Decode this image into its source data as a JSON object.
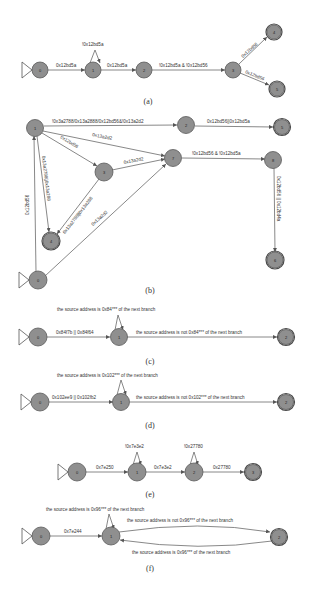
{
  "figures": [
    {
      "caption": "(a)",
      "nodes": [
        "0",
        "1",
        "2",
        "3",
        "4",
        "5"
      ],
      "start": "0",
      "accepting": [
        "4",
        "5"
      ],
      "edges": [
        {
          "from": "0",
          "to": "1",
          "label": "0x12bd5a"
        },
        {
          "from": "1",
          "to": "1",
          "label": "!0x12bd5a"
        },
        {
          "from": "1",
          "to": "2",
          "label": "0x12bd5a"
        },
        {
          "from": "2",
          "to": "3",
          "label": "!0x12bd5a & !0x12bd56"
        },
        {
          "from": "3",
          "to": "4",
          "label": "0x12bd56"
        },
        {
          "from": "3",
          "to": "5",
          "label": "0x12bd56"
        }
      ]
    },
    {
      "caption": "(b)",
      "nodes": [
        "0",
        "1",
        "2",
        "3",
        "4",
        "5",
        "6",
        "7",
        "8"
      ],
      "start": "0",
      "accepting": [
        "4",
        "5",
        "6"
      ],
      "edges": [
        {
          "from": "1",
          "to": "2",
          "label": "!0x3a2788/0x13a2888/0x12bd56&!0x13a2d2"
        },
        {
          "from": "2",
          "to": "5",
          "label": "0x12bd56||0x12bd5a"
        },
        {
          "from": "1",
          "to": "7",
          "label": "0x13a2d2"
        },
        {
          "from": "1",
          "to": "3",
          "label": "0x12bd56"
        },
        {
          "from": "3",
          "to": "7",
          "label": "0x13a2d2"
        },
        {
          "from": "1",
          "to": "4",
          "label": "0x13a2788||0x13a288"
        },
        {
          "from": "3",
          "to": "4",
          "label": "0x13a2788||0x13a288"
        },
        {
          "from": "0",
          "to": "1",
          "label": "0x12bd56"
        },
        {
          "from": "0",
          "to": "7",
          "label": "0x13a2d2"
        },
        {
          "from": "7",
          "to": "8",
          "label": "!0x12bd56 & !0x12bd5a"
        },
        {
          "from": "8",
          "to": "6",
          "label": "0x12bd56 || 0x12bd4a"
        }
      ]
    },
    {
      "caption": "(c)",
      "nodes": [
        "0",
        "1",
        "2"
      ],
      "start": "0",
      "accepting": [
        "2"
      ],
      "edges": [
        {
          "from": "0",
          "to": "1",
          "label": "0x84f7b || 0x84f64"
        },
        {
          "from": "1",
          "to": "1",
          "label": "the source address is 0x84*** of the next branch"
        },
        {
          "from": "1",
          "to": "2",
          "label": "the source address is not 0x84*** of the next branch"
        }
      ]
    },
    {
      "caption": "(d)",
      "nodes": [
        "0",
        "1",
        "2"
      ],
      "start": "0",
      "accepting": [
        "2"
      ],
      "edges": [
        {
          "from": "0",
          "to": "1",
          "label": "0x102ee9 || 0x102fb2"
        },
        {
          "from": "1",
          "to": "1",
          "label": "the source address is 0x102*** of the next branch"
        },
        {
          "from": "1",
          "to": "2",
          "label": "the source address is not 0x102*** of the next branch"
        }
      ]
    },
    {
      "caption": "(e)",
      "nodes": [
        "0",
        "1",
        "2",
        "3"
      ],
      "start": "0",
      "accepting": [
        "3"
      ],
      "edges": [
        {
          "from": "0",
          "to": "1",
          "label": "0x7e250"
        },
        {
          "from": "1",
          "to": "1",
          "label": "!0x7e3e2"
        },
        {
          "from": "1",
          "to": "2",
          "label": "0x7e3e2"
        },
        {
          "from": "2",
          "to": "2",
          "label": "!0x27780"
        },
        {
          "from": "2",
          "to": "3",
          "label": "0x27780"
        }
      ]
    },
    {
      "caption": "(f)",
      "nodes": [
        "0",
        "1",
        "2"
      ],
      "start": "0",
      "accepting": [
        "2"
      ],
      "edges": [
        {
          "from": "0",
          "to": "1",
          "label": "0x7e244"
        },
        {
          "from": "1",
          "to": "1",
          "label": "the source address is 0x96*** of the next branch"
        },
        {
          "from": "1",
          "to": "2",
          "label": "the source address is not 0x96*** of the next branch"
        },
        {
          "from": "2",
          "to": "1",
          "label": "the source address is 0x96*** of the next branch"
        }
      ]
    }
  ]
}
